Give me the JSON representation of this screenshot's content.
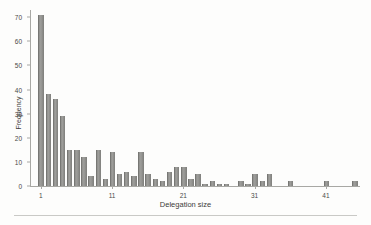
{
  "chart_data": {
    "type": "bar",
    "title": "",
    "xlabel": "Delegation size",
    "ylabel": "Frequency",
    "xlim": [
      0,
      46
    ],
    "ylim": [
      0,
      73
    ],
    "grid": false,
    "legend": null,
    "y_ticks": [
      0,
      10,
      20,
      30,
      40,
      50,
      60,
      70
    ],
    "x_ticks": [
      1,
      11,
      21,
      31,
      41
    ],
    "bar_color": "#8f8f8c",
    "axis_color": "#a8a8a4",
    "categories": [
      1,
      2,
      3,
      4,
      5,
      6,
      7,
      8,
      9,
      10,
      11,
      12,
      13,
      14,
      15,
      16,
      17,
      18,
      19,
      20,
      21,
      22,
      23,
      24,
      25,
      26,
      27,
      28,
      29,
      30,
      31,
      32,
      33,
      34,
      35,
      36,
      37,
      38,
      39,
      40,
      41,
      42,
      43,
      44,
      45
    ],
    "values": [
      71,
      38,
      36,
      29,
      15,
      15,
      12,
      4,
      15,
      3,
      14,
      5,
      6,
      4,
      14,
      5,
      3,
      2,
      6,
      8,
      8,
      3,
      5,
      1,
      2,
      1,
      1,
      0,
      2,
      1,
      5,
      2,
      5,
      0,
      0,
      2,
      0,
      0,
      0,
      0,
      2,
      0,
      0,
      0,
      2
    ]
  }
}
